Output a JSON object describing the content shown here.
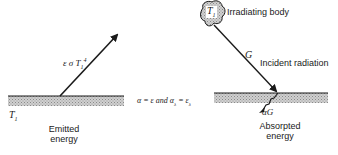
{
  "diagram": {
    "left_panel": {
      "surface_temperature": "T",
      "surface_temperature_sub": "1",
      "emission_label": "ε σ T",
      "emission_label_sub": "1",
      "emission_label_sup": "4",
      "caption_line1": "Emitted",
      "caption_line2": "energy"
    },
    "middle": {
      "relation": "α = ε and α",
      "relation_sub1": "λ",
      "relation_mid": " = ε",
      "relation_sub2": "λ"
    },
    "right_panel": {
      "body_label": "T",
      "body_label_sub": "1",
      "body_caption": "Irradiating body",
      "incident_symbol": "G",
      "incident_caption": "Incident radiation",
      "absorbed_symbol": "αG",
      "caption_line1": "Absorpted",
      "caption_line2": "energy"
    },
    "colors": {
      "line": "#1a1a1a",
      "surface_fill": "#bdbdbd",
      "background": "#ffffff"
    }
  }
}
